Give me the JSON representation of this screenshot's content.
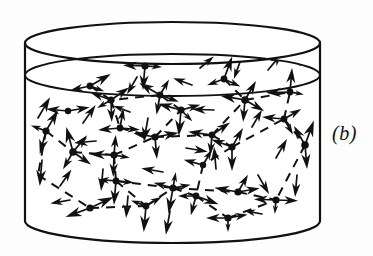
{
  "figure": {
    "panel_label": "(b)",
    "panel_label_x": 332,
    "panel_label_y": 122,
    "caption_kind": "schematic",
    "background_color": "#fdfdfd",
    "ink_color": "#111111"
  },
  "vessel": {
    "name": "cylinder-container",
    "stroke_color": "#111111",
    "stroke_width": 2.2,
    "left_x": 25,
    "right_x": 320,
    "center_x": 172.5,
    "radius_x": 147.5,
    "top_rim_cy": 43,
    "top_rim_ry": 21,
    "surface_cy": 75,
    "surface_ry": 21,
    "bottom_rim_cy": 221,
    "bottom_rim_ry": 22
  },
  "network": {
    "node_color": "#111111",
    "node_radius": 3.4,
    "arrow_color": "#111111",
    "dash_color": "#111111",
    "dash_width": 2.0,
    "dash_pattern": "9 7",
    "nodes": [
      {
        "id": "n1",
        "x": 145,
        "y": 66,
        "r": 3.6,
        "arrows": [
          {
            "a": 182,
            "len": 22
          },
          {
            "a": 3,
            "len": 17
          },
          {
            "a": 95,
            "len": 24
          }
        ]
      },
      {
        "id": "n2",
        "x": 90,
        "y": 86,
        "r": 3.4,
        "arrows": [
          {
            "a": 168,
            "len": 20
          },
          {
            "a": 330,
            "len": 24
          },
          {
            "a": 20,
            "len": 15
          }
        ]
      },
      {
        "id": "n3",
        "x": 111,
        "y": 100,
        "r": 3.6,
        "arrows": [
          {
            "a": 200,
            "len": 22
          },
          {
            "a": 325,
            "len": 22
          },
          {
            "a": 88,
            "len": 22
          },
          {
            "a": 150,
            "len": 16
          }
        ]
      },
      {
        "id": "n4",
        "x": 160,
        "y": 95,
        "r": 3.4,
        "arrows": [
          {
            "a": 210,
            "len": 24
          },
          {
            "a": 20,
            "len": 20
          },
          {
            "a": 300,
            "len": 18
          },
          {
            "a": 100,
            "len": 20
          }
        ]
      },
      {
        "id": "n5",
        "x": 181,
        "y": 110,
        "r": 3.6,
        "arrows": [
          {
            "a": 195,
            "len": 24
          },
          {
            "a": 345,
            "len": 20
          },
          {
            "a": 95,
            "len": 26
          },
          {
            "a": 45,
            "len": 16
          }
        ]
      },
      {
        "id": "n6",
        "x": 224,
        "y": 79,
        "r": 3.4,
        "arrows": [
          {
            "a": 290,
            "len": 24
          },
          {
            "a": 160,
            "len": 18
          },
          {
            "a": 25,
            "len": 18
          }
        ]
      },
      {
        "id": "n7",
        "x": 245,
        "y": 100,
        "r": 3.8,
        "arrows": [
          {
            "a": 190,
            "len": 25
          },
          {
            "a": 300,
            "len": 22
          },
          {
            "a": 30,
            "len": 22
          },
          {
            "a": 95,
            "len": 22
          }
        ]
      },
      {
        "id": "n8",
        "x": 290,
        "y": 92,
        "r": 3.4,
        "arrows": [
          {
            "a": 178,
            "len": 24
          },
          {
            "a": 275,
            "len": 24
          },
          {
            "a": 10,
            "len": 14
          }
        ]
      },
      {
        "id": "n9",
        "x": 284,
        "y": 119,
        "r": 3.4,
        "arrows": [
          {
            "a": 185,
            "len": 22
          },
          {
            "a": 330,
            "len": 20
          },
          {
            "a": 60,
            "len": 18
          }
        ]
      },
      {
        "id": "n10",
        "x": 46,
        "y": 131,
        "r": 3.6,
        "arrows": [
          {
            "a": 300,
            "len": 24
          },
          {
            "a": 105,
            "len": 24
          },
          {
            "a": 200,
            "len": 16
          }
        ]
      },
      {
        "id": "n11",
        "x": 73,
        "y": 152,
        "r": 3.8,
        "arrows": [
          {
            "a": 255,
            "len": 26
          },
          {
            "a": 310,
            "len": 22
          },
          {
            "a": 35,
            "len": 22
          },
          {
            "a": 120,
            "len": 20
          }
        ]
      },
      {
        "id": "n12",
        "x": 114,
        "y": 155,
        "r": 3.6,
        "arrows": [
          {
            "a": 182,
            "len": 24
          },
          {
            "a": 92,
            "len": 22
          },
          {
            "a": 275,
            "len": 20
          },
          {
            "a": 10,
            "len": 16
          }
        ]
      },
      {
        "id": "n13",
        "x": 120,
        "y": 128,
        "r": 3.4,
        "arrows": [
          {
            "a": 175,
            "len": 22
          },
          {
            "a": 280,
            "len": 20
          },
          {
            "a": 5,
            "len": 20
          }
        ]
      },
      {
        "id": "n14",
        "x": 155,
        "y": 137,
        "r": 3.6,
        "arrows": [
          {
            "a": 190,
            "len": 22
          },
          {
            "a": 350,
            "len": 24
          },
          {
            "a": 85,
            "len": 22
          }
        ]
      },
      {
        "id": "n15",
        "x": 212,
        "y": 135,
        "r": 3.4,
        "arrows": [
          {
            "a": 188,
            "len": 24
          },
          {
            "a": 325,
            "len": 22
          },
          {
            "a": 95,
            "len": 20
          }
        ]
      },
      {
        "id": "n16",
        "x": 232,
        "y": 147,
        "r": 3.6,
        "arrows": [
          {
            "a": 200,
            "len": 22
          },
          {
            "a": 300,
            "len": 22
          },
          {
            "a": 90,
            "len": 24
          }
        ]
      },
      {
        "id": "n17",
        "x": 305,
        "y": 145,
        "r": 3.8,
        "arrows": [
          {
            "a": 290,
            "len": 26
          },
          {
            "a": 240,
            "len": 22
          },
          {
            "a": 85,
            "len": 24
          }
        ]
      },
      {
        "id": "n18",
        "x": 116,
        "y": 181,
        "r": 3.4,
        "arrows": [
          {
            "a": 95,
            "len": 24
          },
          {
            "a": 185,
            "len": 18
          },
          {
            "a": 5,
            "len": 18
          }
        ]
      },
      {
        "id": "n19",
        "x": 173,
        "y": 188,
        "r": 3.6,
        "arrows": [
          {
            "a": 100,
            "len": 26
          },
          {
            "a": 195,
            "len": 20
          },
          {
            "a": 350,
            "len": 18
          },
          {
            "a": 280,
            "len": 16
          }
        ]
      },
      {
        "id": "n20",
        "x": 196,
        "y": 196,
        "r": 3.4,
        "arrows": [
          {
            "a": 20,
            "len": 24
          },
          {
            "a": 180,
            "len": 18
          },
          {
            "a": 105,
            "len": 20
          }
        ]
      },
      {
        "id": "n21",
        "x": 238,
        "y": 192,
        "r": 3.6,
        "arrows": [
          {
            "a": 190,
            "len": 24
          },
          {
            "a": 350,
            "len": 22
          },
          {
            "a": 300,
            "len": 20
          }
        ]
      },
      {
        "id": "n22",
        "x": 276,
        "y": 200,
        "r": 3.6,
        "arrows": [
          {
            "a": 182,
            "len": 22
          },
          {
            "a": 2,
            "len": 22
          },
          {
            "a": 95,
            "len": 14
          }
        ]
      },
      {
        "id": "n23",
        "x": 90,
        "y": 208,
        "r": 3.6,
        "arrows": [
          {
            "a": 160,
            "len": 26
          },
          {
            "a": 335,
            "len": 26
          }
        ]
      },
      {
        "id": "n24",
        "x": 146,
        "y": 206,
        "r": 3.4,
        "arrows": [
          {
            "a": 95,
            "len": 26
          },
          {
            "a": 200,
            "len": 16
          },
          {
            "a": 330,
            "len": 18
          }
        ]
      },
      {
        "id": "n25",
        "x": 228,
        "y": 218,
        "r": 3.6,
        "arrows": [
          {
            "a": 180,
            "len": 22
          },
          {
            "a": 350,
            "len": 20
          },
          {
            "a": 90,
            "len": 14
          }
        ]
      },
      {
        "id": "n26",
        "x": 68,
        "y": 111,
        "r": 3.2,
        "arrows": [
          {
            "a": 185,
            "len": 22
          },
          {
            "a": 350,
            "len": 22
          }
        ]
      },
      {
        "id": "n27",
        "x": 203,
        "y": 165,
        "r": 3.2,
        "arrows": [
          {
            "a": 195,
            "len": 20
          },
          {
            "a": 300,
            "len": 18
          }
        ]
      }
    ],
    "free_arrows": [
      {
        "x": 38,
        "y": 118,
        "a": 300,
        "len": 24
      },
      {
        "x": 42,
        "y": 160,
        "a": 95,
        "len": 26
      },
      {
        "x": 60,
        "y": 186,
        "a": 305,
        "len": 20
      },
      {
        "x": 83,
        "y": 123,
        "a": 305,
        "len": 22
      },
      {
        "x": 96,
        "y": 141,
        "a": 175,
        "len": 22
      },
      {
        "x": 103,
        "y": 169,
        "a": 95,
        "len": 22
      },
      {
        "x": 128,
        "y": 196,
        "a": 95,
        "len": 22
      },
      {
        "x": 137,
        "y": 77,
        "a": 120,
        "len": 20
      },
      {
        "x": 148,
        "y": 118,
        "a": 100,
        "len": 24
      },
      {
        "x": 163,
        "y": 172,
        "a": 190,
        "len": 22
      },
      {
        "x": 170,
        "y": 211,
        "a": 100,
        "len": 24
      },
      {
        "x": 186,
        "y": 148,
        "a": 10,
        "len": 22
      },
      {
        "x": 192,
        "y": 85,
        "a": 200,
        "len": 20
      },
      {
        "x": 200,
        "y": 68,
        "a": 320,
        "len": 18
      },
      {
        "x": 214,
        "y": 110,
        "a": 182,
        "len": 22
      },
      {
        "x": 216,
        "y": 169,
        "a": 265,
        "len": 22
      },
      {
        "x": 252,
        "y": 127,
        "a": 300,
        "len": 20
      },
      {
        "x": 258,
        "y": 175,
        "a": 60,
        "len": 22
      },
      {
        "x": 262,
        "y": 214,
        "a": 190,
        "len": 18
      },
      {
        "x": 268,
        "y": 70,
        "a": 310,
        "len": 22
      },
      {
        "x": 276,
        "y": 158,
        "a": 300,
        "len": 22
      },
      {
        "x": 297,
        "y": 175,
        "a": 95,
        "len": 22
      },
      {
        "x": 300,
        "y": 65,
        "a": 285,
        "len": 22
      },
      {
        "x": 70,
        "y": 200,
        "a": 170,
        "len": 20
      },
      {
        "x": 240,
        "y": 62,
        "a": 110,
        "len": 18
      },
      {
        "x": 130,
        "y": 112,
        "a": 200,
        "len": 18
      }
    ],
    "dashed_edges": [
      [
        46,
        131,
        73,
        152
      ],
      [
        73,
        152,
        114,
        155
      ],
      [
        114,
        155,
        116,
        181
      ],
      [
        116,
        181,
        146,
        206
      ],
      [
        90,
        208,
        146,
        206
      ],
      [
        46,
        131,
        38,
        175
      ],
      [
        38,
        175,
        90,
        208
      ],
      [
        146,
        206,
        173,
        188
      ],
      [
        173,
        188,
        196,
        196
      ],
      [
        116,
        181,
        173,
        188
      ],
      [
        173,
        188,
        238,
        192
      ],
      [
        238,
        192,
        276,
        200
      ],
      [
        196,
        196,
        228,
        218
      ],
      [
        228,
        218,
        276,
        200
      ],
      [
        111,
        100,
        120,
        128
      ],
      [
        120,
        128,
        155,
        137
      ],
      [
        155,
        137,
        181,
        110
      ],
      [
        181,
        110,
        160,
        95
      ],
      [
        160,
        95,
        111,
        100
      ],
      [
        155,
        137,
        212,
        135
      ],
      [
        212,
        135,
        245,
        100
      ],
      [
        212,
        135,
        232,
        147
      ],
      [
        232,
        147,
        284,
        119
      ],
      [
        284,
        119,
        290,
        92
      ],
      [
        245,
        100,
        290,
        92
      ],
      [
        224,
        79,
        245,
        100
      ],
      [
        90,
        86,
        111,
        100
      ],
      [
        284,
        119,
        305,
        145
      ],
      [
        305,
        145,
        276,
        200
      ],
      [
        232,
        147,
        203,
        165
      ],
      [
        203,
        165,
        196,
        196
      ],
      [
        114,
        155,
        155,
        137
      ]
    ]
  }
}
